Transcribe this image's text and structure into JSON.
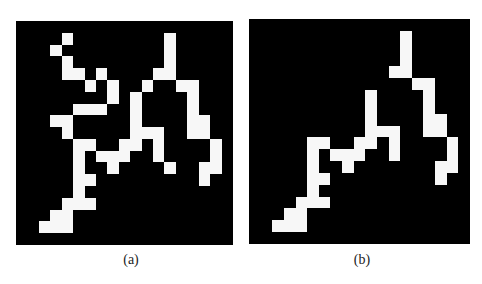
{
  "figure": {
    "grid_size": 19,
    "colors": {
      "background": "#000000",
      "foreground": "#f7f7f7"
    },
    "panels": [
      {
        "id": "a",
        "caption": "(a)",
        "cells": [
          [
            1,
            4
          ],
          [
            1,
            13
          ],
          [
            2,
            3
          ],
          [
            2,
            13
          ],
          [
            3,
            4
          ],
          [
            3,
            13
          ],
          [
            4,
            4
          ],
          [
            4,
            5
          ],
          [
            4,
            7
          ],
          [
            4,
            12
          ],
          [
            4,
            13
          ],
          [
            5,
            6
          ],
          [
            5,
            8
          ],
          [
            5,
            11
          ],
          [
            5,
            14
          ],
          [
            5,
            15
          ],
          [
            6,
            8
          ],
          [
            6,
            10
          ],
          [
            6,
            15
          ],
          [
            7,
            5
          ],
          [
            7,
            6
          ],
          [
            7,
            7
          ],
          [
            7,
            10
          ],
          [
            7,
            15
          ],
          [
            8,
            3
          ],
          [
            8,
            4
          ],
          [
            8,
            10
          ],
          [
            8,
            15
          ],
          [
            8,
            16
          ],
          [
            9,
            4
          ],
          [
            9,
            10
          ],
          [
            9,
            11
          ],
          [
            9,
            12
          ],
          [
            9,
            15
          ],
          [
            9,
            16
          ],
          [
            10,
            5
          ],
          [
            10,
            6
          ],
          [
            10,
            9
          ],
          [
            10,
            10
          ],
          [
            10,
            12
          ],
          [
            10,
            17
          ],
          [
            11,
            5
          ],
          [
            11,
            7
          ],
          [
            11,
            8
          ],
          [
            11,
            9
          ],
          [
            11,
            12
          ],
          [
            11,
            17
          ],
          [
            12,
            5
          ],
          [
            12,
            8
          ],
          [
            12,
            13
          ],
          [
            12,
            16
          ],
          [
            12,
            17
          ],
          [
            13,
            5
          ],
          [
            13,
            6
          ],
          [
            13,
            16
          ],
          [
            14,
            5
          ],
          [
            15,
            4
          ],
          [
            15,
            5
          ],
          [
            15,
            6
          ],
          [
            16,
            3
          ],
          [
            16,
            4
          ],
          [
            17,
            2
          ],
          [
            17,
            3
          ],
          [
            17,
            4
          ]
        ]
      },
      {
        "id": "b",
        "caption": "(b)",
        "cells": [
          [
            1,
            13
          ],
          [
            2,
            13
          ],
          [
            3,
            13
          ],
          [
            4,
            12
          ],
          [
            4,
            13
          ],
          [
            5,
            14
          ],
          [
            5,
            15
          ],
          [
            6,
            10
          ],
          [
            6,
            15
          ],
          [
            7,
            10
          ],
          [
            7,
            15
          ],
          [
            8,
            10
          ],
          [
            8,
            15
          ],
          [
            8,
            16
          ],
          [
            9,
            10
          ],
          [
            9,
            11
          ],
          [
            9,
            12
          ],
          [
            9,
            15
          ],
          [
            9,
            16
          ],
          [
            10,
            5
          ],
          [
            10,
            6
          ],
          [
            10,
            9
          ],
          [
            10,
            10
          ],
          [
            10,
            12
          ],
          [
            10,
            17
          ],
          [
            11,
            5
          ],
          [
            11,
            7
          ],
          [
            11,
            8
          ],
          [
            11,
            9
          ],
          [
            11,
            12
          ],
          [
            11,
            17
          ],
          [
            12,
            5
          ],
          [
            12,
            8
          ],
          [
            12,
            16
          ],
          [
            12,
            17
          ],
          [
            13,
            5
          ],
          [
            13,
            6
          ],
          [
            13,
            16
          ],
          [
            14,
            5
          ],
          [
            15,
            4
          ],
          [
            15,
            5
          ],
          [
            15,
            6
          ],
          [
            16,
            3
          ],
          [
            16,
            4
          ],
          [
            17,
            2
          ],
          [
            17,
            3
          ],
          [
            17,
            4
          ]
        ]
      }
    ]
  }
}
